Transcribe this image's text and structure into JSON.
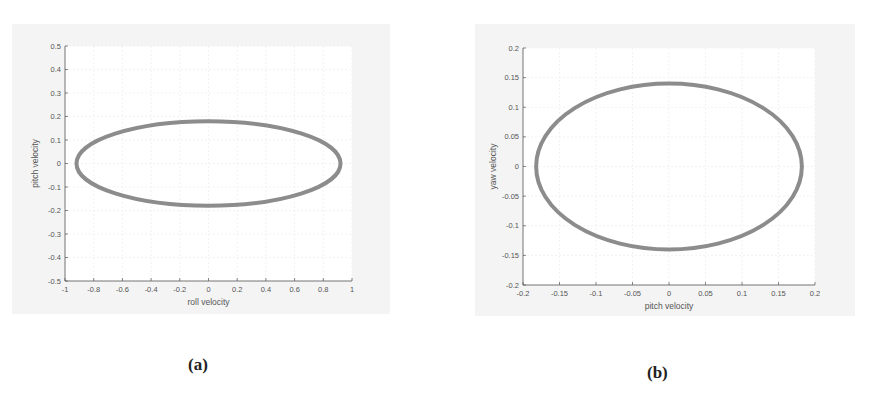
{
  "chart_data": [
    {
      "id": "a",
      "type": "scatter",
      "title": "",
      "caption": "(a)",
      "xlabel": "roll velocity",
      "ylabel": "pitch velocity",
      "xlim": [
        -1,
        1
      ],
      "ylim": [
        -0.5,
        0.5
      ],
      "xticks": [
        "-1",
        "-0.8",
        "-0.6",
        "-0.4",
        "-0.2",
        "0",
        "0.2",
        "0.4",
        "0.6",
        "0.8",
        "1"
      ],
      "yticks": [
        "0.5",
        "0.4",
        "0.3",
        "0.2",
        "0.1",
        "0",
        "-0.1",
        "-0.2",
        "-0.3",
        "-0.4",
        "-0.5"
      ],
      "grid": true,
      "legend": null,
      "series": [
        {
          "name": "trajectory",
          "shape": "ellipse",
          "center": [
            0,
            0
          ],
          "semi_axis_x": 0.92,
          "semi_axis_y": 0.18,
          "color": "#8c8c8c"
        }
      ]
    },
    {
      "id": "b",
      "type": "scatter",
      "title": "",
      "caption": "(b)",
      "xlabel": "pitch velocity",
      "ylabel": "yaw velocity",
      "xlim": [
        -0.2,
        0.2
      ],
      "ylim": [
        -0.2,
        0.2
      ],
      "xticks": [
        "-0.2",
        "-0.15",
        "-0.1",
        "-0.05",
        "0",
        "0.05",
        "0.1",
        "0.15",
        "0.2"
      ],
      "yticks": [
        "0.2",
        "0.15",
        "0.1",
        "0.05",
        "0",
        "-0.05",
        "-0.1",
        "-0.15",
        "-0.2"
      ],
      "grid": true,
      "legend": null,
      "series": [
        {
          "name": "trajectory",
          "shape": "ellipse",
          "center": [
            0,
            0
          ],
          "semi_axis_x": 0.182,
          "semi_axis_y": 0.14,
          "color": "#8c8c8c"
        }
      ]
    }
  ],
  "captions": {
    "a": "(a)",
    "b": "(b)"
  }
}
